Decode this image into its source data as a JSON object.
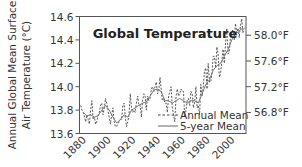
{
  "chart_data": {
    "type": "line",
    "title": "Global Temperature",
    "xlabel": "",
    "ylabel": "Annual Global Mean Surface Air Temperature (°C)",
    "ylabel_lines": [
      "Annual Global Mean Surface",
      "Air Temperature (°C)"
    ],
    "ylim": [
      13.6,
      14.6
    ],
    "xlim": [
      1879,
      2014
    ],
    "grid": false,
    "legend_position": "lower right",
    "x_ticks": [
      "1880",
      "1900",
      "1920",
      "1940",
      "1960",
      "1980",
      "2000"
    ],
    "y_ticks": [
      "13.6",
      "13.8",
      "14.0",
      "14.2",
      "14.4",
      "14.6"
    ],
    "y2_ticks": [
      {
        "label": "58.0°F",
        "celsius": 14.44
      },
      {
        "label": "57.6°F",
        "celsius": 14.22
      },
      {
        "label": "57.2°F",
        "celsius": 14.0
      },
      {
        "label": "56.8°F",
        "celsius": 13.78
      }
    ],
    "series": [
      {
        "name": "Annual Mean",
        "style": "dashed",
        "x": [
          1880,
          1881,
          1882,
          1883,
          1884,
          1885,
          1886,
          1887,
          1888,
          1889,
          1890,
          1891,
          1892,
          1893,
          1894,
          1895,
          1896,
          1897,
          1898,
          1899,
          1900,
          1901,
          1902,
          1903,
          1904,
          1905,
          1906,
          1907,
          1908,
          1909,
          1910,
          1911,
          1912,
          1913,
          1914,
          1915,
          1916,
          1917,
          1918,
          1919,
          1920,
          1921,
          1922,
          1923,
          1924,
          1925,
          1926,
          1927,
          1928,
          1929,
          1930,
          1931,
          1932,
          1933,
          1934,
          1935,
          1936,
          1937,
          1938,
          1939,
          1940,
          1941,
          1942,
          1943,
          1944,
          1945,
          1946,
          1947,
          1948,
          1949,
          1950,
          1951,
          1952,
          1953,
          1954,
          1955,
          1956,
          1957,
          1958,
          1959,
          1960,
          1961,
          1962,
          1963,
          1964,
          1965,
          1966,
          1967,
          1968,
          1969,
          1970,
          1971,
          1972,
          1973,
          1974,
          1975,
          1976,
          1977,
          1978,
          1979,
          1980,
          1981,
          1982,
          1983,
          1984,
          1985,
          1986,
          1987,
          1988,
          1989,
          1990,
          1991,
          1992,
          1993,
          1994,
          1995,
          1996,
          1997,
          1998,
          1999,
          2000,
          2001,
          2002,
          2003,
          2004,
          2005,
          2006,
          2007,
          2008,
          2009,
          2010,
          2011,
          2012,
          2013
        ],
        "values": [
          13.84,
          13.8,
          13.78,
          13.74,
          13.7,
          13.76,
          13.72,
          13.68,
          13.8,
          13.88,
          13.72,
          13.74,
          13.68,
          13.7,
          13.76,
          13.78,
          13.84,
          13.86,
          13.76,
          13.82,
          13.9,
          13.86,
          13.8,
          13.74,
          13.68,
          13.76,
          13.82,
          13.7,
          13.66,
          13.66,
          13.68,
          13.7,
          13.72,
          13.72,
          13.84,
          13.86,
          13.74,
          13.66,
          13.7,
          13.76,
          13.94,
          13.82,
          13.78,
          13.8,
          13.78,
          13.86,
          13.92,
          13.84,
          13.84,
          13.74,
          13.88,
          13.94,
          13.92,
          13.8,
          13.92,
          13.88,
          13.9,
          13.98,
          14.0,
          13.96,
          14.0,
          14.04,
          13.94,
          13.96,
          14.08,
          13.98,
          13.88,
          13.9,
          13.86,
          13.86,
          13.78,
          13.92,
          13.96,
          14.0,
          13.82,
          13.76,
          13.7,
          13.92,
          13.98,
          13.92,
          13.94,
          13.98,
          13.96,
          13.96,
          13.74,
          13.8,
          13.88,
          13.9,
          13.84,
          13.96,
          13.94,
          13.82,
          13.86,
          14.0,
          13.82,
          13.84,
          13.76,
          14.02,
          13.92,
          14.0,
          14.14,
          14.16,
          13.98,
          14.2,
          14.04,
          14.04,
          14.12,
          14.26,
          14.26,
          14.16,
          14.34,
          14.28,
          14.08,
          14.12,
          14.22,
          14.32,
          14.2,
          14.38,
          14.5,
          14.28,
          14.3,
          14.42,
          14.48,
          14.48,
          14.4,
          14.54,
          14.46,
          14.5,
          14.42,
          14.52,
          14.58,
          14.46,
          14.5,
          14.52
        ]
      },
      {
        "name": "5-year Mean",
        "style": "solid",
        "x": [
          1882,
          1885,
          1888,
          1891,
          1894,
          1897,
          1900,
          1903,
          1906,
          1909,
          1912,
          1915,
          1918,
          1921,
          1924,
          1927,
          1930,
          1933,
          1936,
          1939,
          1942,
          1945,
          1948,
          1951,
          1954,
          1957,
          1960,
          1963,
          1966,
          1969,
          1972,
          1975,
          1978,
          1981,
          1984,
          1987,
          1990,
          1993,
          1996,
          1999,
          2002,
          2005,
          2008,
          2011
        ],
        "values": [
          13.78,
          13.75,
          13.76,
          13.74,
          13.75,
          13.8,
          13.84,
          13.8,
          13.74,
          13.69,
          13.72,
          13.76,
          13.74,
          13.8,
          13.82,
          13.84,
          13.86,
          13.87,
          13.92,
          13.97,
          13.98,
          13.96,
          13.88,
          13.88,
          13.86,
          13.88,
          13.9,
          13.88,
          13.86,
          13.88,
          13.88,
          13.86,
          13.94,
          14.02,
          14.06,
          14.14,
          14.18,
          14.2,
          14.26,
          14.32,
          14.4,
          14.45,
          14.48,
          14.5
        ]
      }
    ]
  }
}
